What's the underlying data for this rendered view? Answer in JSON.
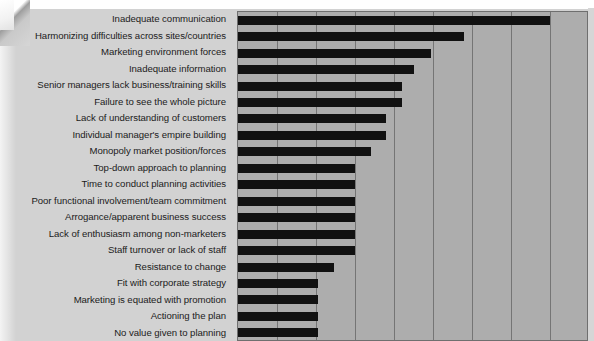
{
  "chart_data": {
    "type": "bar",
    "orientation": "horizontal",
    "title": "",
    "xlabel": "",
    "ylabel": "",
    "grid": true,
    "legend": null,
    "xlim": [
      0,
      9
    ],
    "axis_note": "unlabelled gridlines, 9 equal intervals",
    "categories": [
      "Inadequate communication",
      "Harmonizing difficulties across sites/countries",
      "Marketing environment forces",
      "Inadequate information",
      "Senior managers lack business/training skills",
      "Failure to see the whole picture",
      "Lack of understanding of customers",
      "Individual manager's empire building",
      "Monopoly market position/forces",
      "Top-down approach to planning",
      "Time to conduct planning activities",
      "Poor functional involvement/team commitment",
      "Arrogance/apparent business success",
      "Lack of enthusiasm among non-marketers",
      "Staff turnover or lack of staff",
      "Resistance to change",
      "Fit with corporate strategy",
      "Marketing is equated with promotion",
      "Actioning the plan",
      "No value given to planning"
    ],
    "values": [
      8.0,
      5.8,
      4.95,
      4.5,
      4.2,
      4.2,
      3.8,
      3.8,
      3.4,
      3.0,
      3.0,
      3.0,
      3.0,
      3.0,
      3.0,
      2.45,
      2.05,
      2.05,
      2.05,
      2.05
    ],
    "bar_color": "#111111",
    "plot_background": "#adadad",
    "gridline_color": "#757575"
  },
  "page": {
    "background": "#d2d2d2"
  }
}
